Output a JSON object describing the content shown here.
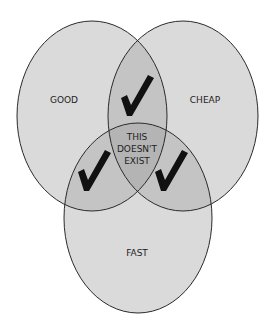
{
  "diagram": {
    "type": "venn",
    "sets": [
      {
        "id": "good",
        "label": "GOOD"
      },
      {
        "id": "cheap",
        "label": "CHEAP"
      },
      {
        "id": "fast",
        "label": "FAST"
      }
    ],
    "intersections": [
      {
        "sets": [
          "good",
          "cheap"
        ],
        "mark": "checkmark"
      },
      {
        "sets": [
          "good",
          "fast"
        ],
        "mark": "checkmark"
      },
      {
        "sets": [
          "cheap",
          "fast"
        ],
        "mark": "checkmark"
      },
      {
        "sets": [
          "good",
          "cheap",
          "fast"
        ],
        "lines": [
          "THIS",
          "DOESN'T",
          "EXIST"
        ]
      }
    ],
    "colors": {
      "fill": "#d9d9d9",
      "overlap": "#c2c2c2",
      "center": "#b0b0b0",
      "stroke": "#2a2a2a",
      "check": "#111111"
    }
  }
}
